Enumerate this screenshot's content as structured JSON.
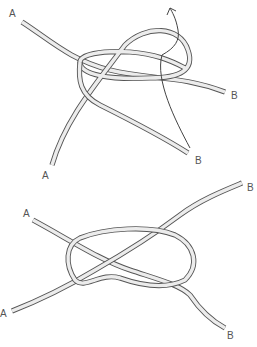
{
  "diagram": {
    "type": "knot-tying-illustration",
    "steps": [
      {
        "id": "step-1",
        "description": "Two rope ends A and B being intertwined; end B passes through loop, arrow indicates pulling direction",
        "labels": [
          {
            "text": "A",
            "x": 9,
            "y": 9
          },
          {
            "text": "B",
            "x": 231,
            "y": 91
          },
          {
            "text": "B",
            "x": 195,
            "y": 156
          },
          {
            "text": "A",
            "x": 42,
            "y": 171
          }
        ],
        "arrow": {
          "direction": "up-left",
          "x": 173,
          "y": 6
        }
      },
      {
        "id": "step-2",
        "description": "Completed knot with ends A at left and B at right",
        "labels": [
          {
            "text": "A",
            "x": 23,
            "y": 209
          },
          {
            "text": "B",
            "x": 247,
            "y": 183
          },
          {
            "text": "A",
            "x": 0,
            "y": 309
          },
          {
            "text": "B",
            "x": 227,
            "y": 331
          }
        ]
      }
    ],
    "label_color": "#555555",
    "rope_fill": "#ececec",
    "rope_outline": "#555555"
  }
}
